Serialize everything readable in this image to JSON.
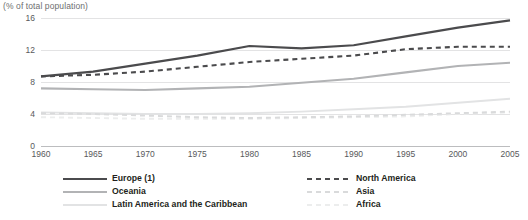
{
  "chart_data": {
    "type": "line",
    "title": "(% of total population)",
    "xlabel": "",
    "ylabel": "",
    "x": [
      1960,
      1965,
      1970,
      1975,
      1980,
      1985,
      1990,
      1995,
      2000,
      2005
    ],
    "tick_labels_x": [
      "1960",
      "1965",
      "1970",
      "1975",
      "1980",
      "1985",
      "1990",
      "1995",
      "2000",
      "2005"
    ],
    "tick_labels_y": [
      "16",
      "12",
      "8",
      "4",
      "0"
    ],
    "ylim": [
      0,
      16
    ],
    "yticks": [
      0,
      4,
      8,
      12,
      16
    ],
    "grid": true,
    "legend_position": "bottom",
    "series": [
      {
        "name": "Europe (1)",
        "style": "solid",
        "color": "#4b4b4d",
        "width": 2.1,
        "values": [
          8.7,
          9.3,
          10.3,
          11.3,
          12.5,
          12.2,
          12.6,
          13.7,
          14.8,
          15.7
        ]
      },
      {
        "name": "North America",
        "style": "dashed",
        "color": "#4b4b4d",
        "width": 2.1,
        "values": [
          8.7,
          8.9,
          9.3,
          9.9,
          10.5,
          10.9,
          11.3,
          12.1,
          12.4,
          12.4
        ]
      },
      {
        "name": "Oceania",
        "style": "solid",
        "color": "#b2b3b5",
        "width": 2.1,
        "values": [
          7.2,
          7.1,
          7.0,
          7.2,
          7.4,
          7.9,
          8.4,
          9.2,
          10.0,
          10.4
        ]
      },
      {
        "name": "Asia",
        "style": "dashed",
        "color": "#d9dadb",
        "width": 1.9,
        "values": [
          4.1,
          4.0,
          3.8,
          3.6,
          3.5,
          3.6,
          3.7,
          3.9,
          4.1,
          4.3
        ]
      },
      {
        "name": "Latin America and the Caribbean",
        "style": "solid",
        "color": "#e2e3e4",
        "width": 1.9,
        "values": [
          4.2,
          4.1,
          4.0,
          4.0,
          4.1,
          4.3,
          4.6,
          4.9,
          5.4,
          5.9
        ]
      },
      {
        "name": "Africa",
        "style": "dashed",
        "color": "#eceded",
        "width": 1.9,
        "values": [
          3.6,
          3.5,
          3.4,
          3.4,
          3.4,
          3.5,
          3.6,
          3.7,
          4.0,
          4.2
        ]
      }
    ]
  },
  "legend": {
    "left_column": [
      {
        "label": "Europe (1)",
        "series": 0
      },
      {
        "label": "Oceania",
        "series": 2
      },
      {
        "label": "Latin America and the Caribbean",
        "series": 4
      }
    ],
    "right_column": [
      {
        "label": "North America",
        "series": 1
      },
      {
        "label": "Asia",
        "series": 3
      },
      {
        "label": "Africa",
        "series": 5
      }
    ]
  },
  "colors": {
    "background": "#ffffff",
    "gridline": "#e3e3e4",
    "baseline": "#bcbdbf",
    "tick_text": "#58595b",
    "title_text": "#6d6e70",
    "legend_text": "#231f20"
  }
}
